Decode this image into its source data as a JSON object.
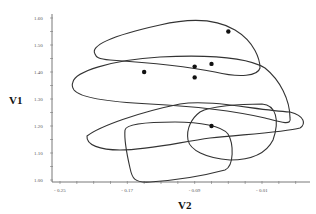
{
  "chart_data": {
    "type": "scatter",
    "title": "",
    "xlabel": "V2",
    "ylabel": "V1",
    "xlim": [
      -0.26,
      0.03
    ],
    "ylim": [
      1.0,
      1.6
    ],
    "x_ticks": [
      "- 0.25",
      "- 0.17",
      "- 0.09",
      "- 0.01"
    ],
    "x_tick_values": [
      -0.25,
      -0.17,
      -0.09,
      -0.01
    ],
    "y_ticks": [
      "1.00",
      "1.10",
      "1.20",
      "1.30",
      "1.40",
      "1.50",
      "1.60"
    ],
    "y_tick_values": [
      1.0,
      1.1,
      1.2,
      1.3,
      1.4,
      1.5,
      1.6
    ],
    "grid": false,
    "legend": null,
    "series": [
      {
        "name": "points",
        "points": [
          {
            "x": -0.05,
            "y": 1.55
          },
          {
            "x": -0.15,
            "y": 1.4
          },
          {
            "x": -0.09,
            "y": 1.42
          },
          {
            "x": -0.07,
            "y": 1.43
          },
          {
            "x": -0.09,
            "y": 1.38
          },
          {
            "x": -0.07,
            "y": 1.2
          }
        ]
      }
    ],
    "contours": [
      {
        "name": "contour-1",
        "description": "upper elongated loop, V2 -0.20 to -0.04, V1 1.38 to 1.58"
      },
      {
        "name": "contour-2",
        "description": "middle wide loop, V2 -0.23 to 0.00, V1 1.18 to 1.46"
      },
      {
        "name": "contour-3",
        "description": "right loop, V2 -0.10 to 0.02, V1 1.06 to 1.32"
      },
      {
        "name": "contour-4",
        "description": "lower wide loop, V2 -0.20 to 0.00, V1 1.08 to 1.26"
      },
      {
        "name": "contour-5",
        "description": "bottom rounded-rect loop, V2 -0.16 to -0.08, V1 1.00 to 1.22"
      }
    ]
  },
  "axes": {
    "x_title": "V2",
    "y_title": "V1"
  }
}
